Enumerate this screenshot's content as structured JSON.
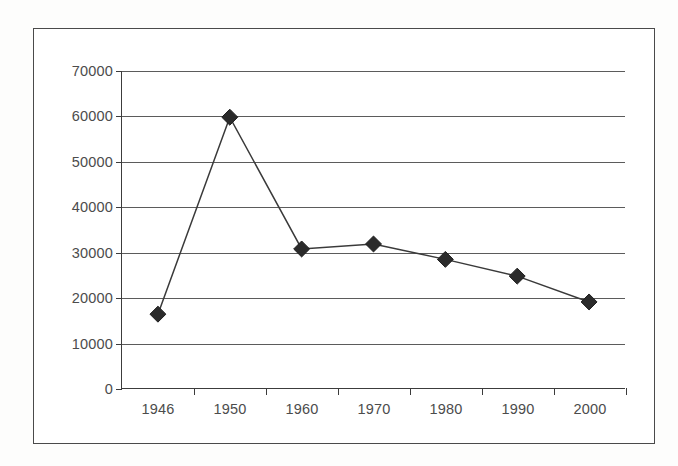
{
  "chart_data": {
    "type": "line",
    "title": "",
    "subtitle": "",
    "xlabel": "",
    "ylabel": "",
    "categories": [
      "1946",
      "1950",
      "1960",
      "1970",
      "1980",
      "1990",
      "2000"
    ],
    "values": [
      16300,
      59800,
      30700,
      31800,
      28400,
      24700,
      19000
    ],
    "series": [
      {
        "name": "",
        "values": [
          16300,
          59800,
          30700,
          31800,
          28400,
          24700,
          19000
        ]
      }
    ],
    "ylim": [
      0,
      70000
    ],
    "ytick_step": 10000,
    "ytick_labels": [
      "0",
      "10000",
      "20000",
      "30000",
      "40000",
      "50000",
      "60000",
      "70000"
    ],
    "ytick_values": [
      0,
      10000,
      20000,
      30000,
      40000,
      50000,
      60000,
      70000
    ],
    "xtick_labels": [
      "1946",
      "1950",
      "1960",
      "1970",
      "1980",
      "1990",
      "2000"
    ],
    "grid": "horizontal",
    "legend": "none",
    "marker": "diamond",
    "annotations": [],
    "colors": {
      "line": "#3a3a3a",
      "marker": "#2b2b2b",
      "gridline": "#5b5b5b",
      "axis": "#3c3c3c",
      "frame": "#4a4a4a",
      "text": "#4c4c4c",
      "background": "#ffffff"
    }
  }
}
